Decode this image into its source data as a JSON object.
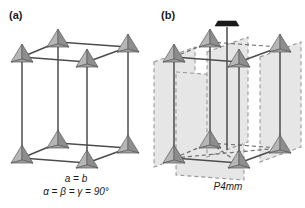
{
  "figure": {
    "background_color": "#ffffff",
    "width": 305,
    "height": 208
  },
  "panels": [
    {
      "label": "(a)",
      "name": "tetragonal-lattice-panel",
      "captions": [
        "a = b",
        "α = β = γ = 90°"
      ],
      "motif_icon": "pyramid-icon",
      "motif_count": 8,
      "cell_edge_color": "#4d4d4d"
    },
    {
      "label": "(b)",
      "name": "space-group-panel",
      "captions": [
        "P4mm"
      ],
      "symmetry_axis_icon": "four-fold-axis-icon",
      "mirror_plane_count": 4,
      "mirror_plane_color": "#e6e6e6",
      "mirror_plane_edge_style": "dashed",
      "motif_icon": "pyramid-icon",
      "motif_count": 8,
      "cell_edge_color": "#4d4d4d"
    }
  ],
  "colors": {
    "pyramid_light_face": "#b2b2b2",
    "pyramid_dark_face": "#8c8c8c",
    "pyramid_outline": "#5a5a5a",
    "edge": "#4d4d4d",
    "plane_fill": "#e6e6e6",
    "plane_dash": "#9a9a9a",
    "axis_symbol": "#1a1a1a",
    "text": "#1a1a1a"
  }
}
